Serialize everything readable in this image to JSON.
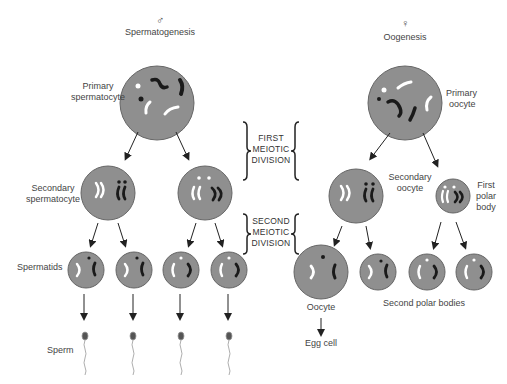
{
  "diagram": {
    "male": {
      "symbol": "♂",
      "title": "Spermatogenesis",
      "primary_label": [
        "Primary",
        "spermatocyte"
      ],
      "secondary_label": [
        "Secondary",
        "spermatocyte"
      ],
      "spermatids_label": "Spermatids",
      "sperm_label": "Sperm"
    },
    "female": {
      "symbol": "♀",
      "title": "Oogenesis",
      "primary_label": [
        "Primary",
        "oocyte"
      ],
      "secondary_label": [
        "Secondary",
        "oocyte"
      ],
      "first_polar_label": [
        "First",
        "polar",
        "body"
      ],
      "oocyte_label": "Oocyte",
      "egg_label": "Egg cell",
      "second_polar_label": "Second polar bodies"
    },
    "divisions": {
      "first": [
        "FIRST",
        "MEIOTIC",
        "DIVISION"
      ],
      "second": [
        "SECOND",
        "MEIOTIC",
        "DIVISION"
      ]
    },
    "colors": {
      "cell_fill": "#8f8f8f",
      "cell_stroke": "#555555",
      "chromosome_dark": "#1a1a1a",
      "chromosome_light": "#ffffff",
      "arrow": "#222222"
    }
  }
}
